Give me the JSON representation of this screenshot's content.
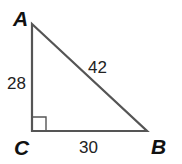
{
  "diagram": {
    "type": "right-triangle",
    "vertices": [
      {
        "id": "A",
        "label": "A",
        "x": 32,
        "y": 24
      },
      {
        "id": "B",
        "label": "B",
        "x": 147,
        "y": 131
      },
      {
        "id": "C",
        "label": "C",
        "x": 32,
        "y": 131
      }
    ],
    "sides": [
      {
        "id": "AC",
        "label": "28"
      },
      {
        "id": "AB",
        "label": "42"
      },
      {
        "id": "CB",
        "label": "30"
      }
    ],
    "right_angle_at": "C",
    "colors": {
      "stroke": "#555555",
      "text": "#111111"
    }
  }
}
